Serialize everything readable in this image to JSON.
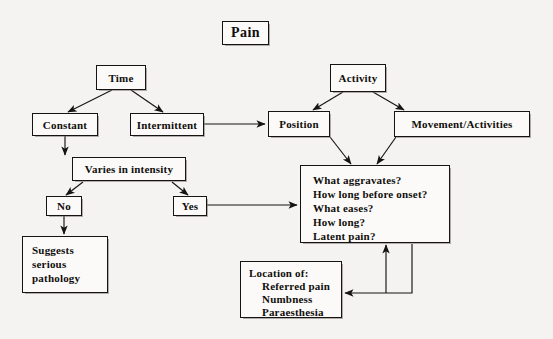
{
  "diagram": {
    "title": "Pain",
    "type": "flowchart",
    "background_color": "#f4f3f1",
    "line_color": "#161412",
    "box_fill": "#fbfaf8",
    "nodes": {
      "pain": {
        "label": "Pain"
      },
      "time": {
        "label": "Time"
      },
      "constant": {
        "label": "Constant"
      },
      "intermittent": {
        "label": "Intermittent"
      },
      "varies": {
        "label": "Varies in intensity"
      },
      "no": {
        "label": "No"
      },
      "yes": {
        "label": "Yes"
      },
      "suggests": {
        "lines": [
          "Suggests",
          "serious",
          "pathology"
        ]
      },
      "activity": {
        "label": "Activity"
      },
      "position": {
        "label": "Position"
      },
      "movement": {
        "label": "Movement/Activities"
      },
      "questions": {
        "lines": [
          "What aggravates?",
          "How long before onset?",
          "What eases?",
          "How long?",
          "Latent pain?"
        ]
      },
      "location": {
        "heading": "Location of:",
        "items": [
          "Referred pain",
          "Numbness",
          "Paraesthesia"
        ]
      }
    },
    "edges": [
      {
        "from": "time",
        "to": "constant"
      },
      {
        "from": "time",
        "to": "intermittent"
      },
      {
        "from": "constant",
        "to": "varies"
      },
      {
        "from": "intermittent",
        "to": "position"
      },
      {
        "from": "varies",
        "to": "no"
      },
      {
        "from": "varies",
        "to": "yes"
      },
      {
        "from": "no",
        "to": "suggests"
      },
      {
        "from": "yes",
        "to": "questions"
      },
      {
        "from": "activity",
        "to": "position"
      },
      {
        "from": "activity",
        "to": "movement"
      },
      {
        "from": "position",
        "to": "questions"
      },
      {
        "from": "movement",
        "to": "questions"
      },
      {
        "from": "location",
        "to": "questions"
      },
      {
        "from": "questions",
        "to": "location"
      }
    ]
  }
}
